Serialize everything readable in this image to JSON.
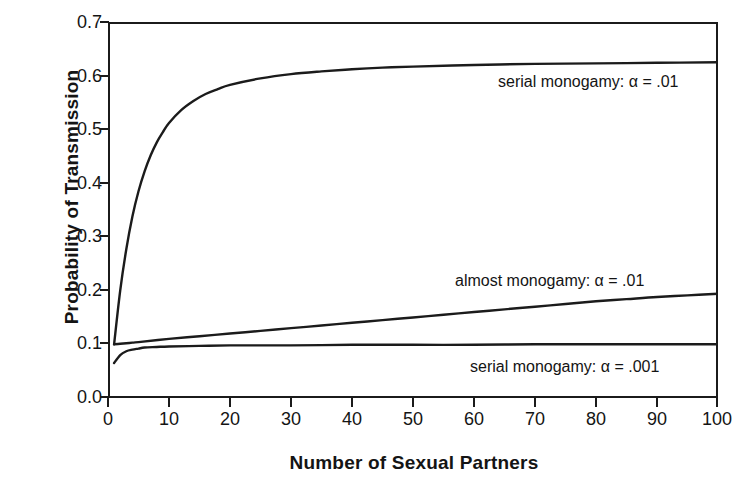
{
  "chart_data": {
    "type": "line",
    "title": "",
    "xlabel": "Number of Sexual Partners",
    "ylabel": "Probability of Transmission",
    "xlim": [
      0,
      100
    ],
    "ylim": [
      0.0,
      0.7
    ],
    "grid": false,
    "legend_position": "inline-annotations",
    "xticks": [
      "0",
      "10",
      "20",
      "30",
      "40",
      "50",
      "60",
      "70",
      "80",
      "90",
      "100"
    ],
    "xtick_values": [
      0,
      10,
      20,
      30,
      40,
      50,
      60,
      70,
      80,
      90,
      100
    ],
    "yticks": [
      "0.0",
      "0.1",
      "0.2",
      "0.3",
      "0.4",
      "0.5",
      "0.6",
      "0.7"
    ],
    "ytick_values": [
      0.0,
      0.1,
      0.2,
      0.3,
      0.4,
      0.5,
      0.6,
      0.7
    ],
    "series": [
      {
        "name": "serial monogamy:  α = .01",
        "label_x": 65,
        "label_y": 0.605,
        "x": [
          1,
          2,
          3,
          4,
          5,
          6,
          7,
          8,
          9,
          10,
          12,
          14,
          16,
          18,
          20,
          25,
          30,
          35,
          40,
          45,
          50,
          60,
          70,
          80,
          90,
          100
        ],
        "values": [
          0.1,
          0.2,
          0.277,
          0.338,
          0.385,
          0.422,
          0.452,
          0.476,
          0.495,
          0.512,
          0.536,
          0.553,
          0.566,
          0.575,
          0.583,
          0.595,
          0.603,
          0.608,
          0.612,
          0.615,
          0.617,
          0.62,
          0.622,
          0.623,
          0.624,
          0.625
        ]
      },
      {
        "name": "almost monogamy:  α = .01",
        "label_x": 58,
        "label_y": 0.215,
        "x": [
          1,
          2,
          3,
          4,
          5,
          10,
          15,
          20,
          25,
          30,
          35,
          40,
          45,
          50,
          55,
          60,
          65,
          70,
          75,
          80,
          85,
          90,
          95,
          100
        ],
        "values": [
          0.1,
          0.101,
          0.102,
          0.103,
          0.104,
          0.11,
          0.115,
          0.12,
          0.125,
          0.13,
          0.135,
          0.14,
          0.145,
          0.15,
          0.155,
          0.16,
          0.165,
          0.17,
          0.175,
          0.18,
          0.184,
          0.188,
          0.191,
          0.194
        ]
      },
      {
        "name": "serial monogamy:  α = .001",
        "label_x": 60,
        "label_y": 0.072,
        "x": [
          1,
          2,
          3,
          4,
          5,
          6,
          8,
          10,
          15,
          20,
          30,
          40,
          50,
          60,
          70,
          80,
          90,
          100
        ],
        "values": [
          0.065,
          0.08,
          0.087,
          0.09,
          0.092,
          0.094,
          0.095,
          0.096,
          0.097,
          0.098,
          0.098,
          0.099,
          0.099,
          0.099,
          0.1,
          0.1,
          0.1,
          0.1
        ]
      }
    ],
    "colors": {
      "curve": "#1b1b1b",
      "axis": "#1b1b1b",
      "text": "#141414",
      "background": "#ffffff"
    }
  },
  "axes": {
    "y_title": "Probability of Transmission",
    "x_title": "Number of Sexual Partners",
    "y_labels": [
      "0.7",
      "0.6",
      "0.5",
      "0.4",
      "0.3",
      "0.2",
      "0.1",
      "0.0"
    ],
    "x_labels": [
      "0",
      "10",
      "20",
      "30",
      "40",
      "50",
      "60",
      "70",
      "80",
      "90",
      "100"
    ]
  },
  "annotations": {
    "serial_monogamy_01": "serial monogamy:  α = .01",
    "almost_monogamy_01": "almost monogamy:  α = .01",
    "serial_monogamy_001": "serial monogamy:  α = .001"
  }
}
